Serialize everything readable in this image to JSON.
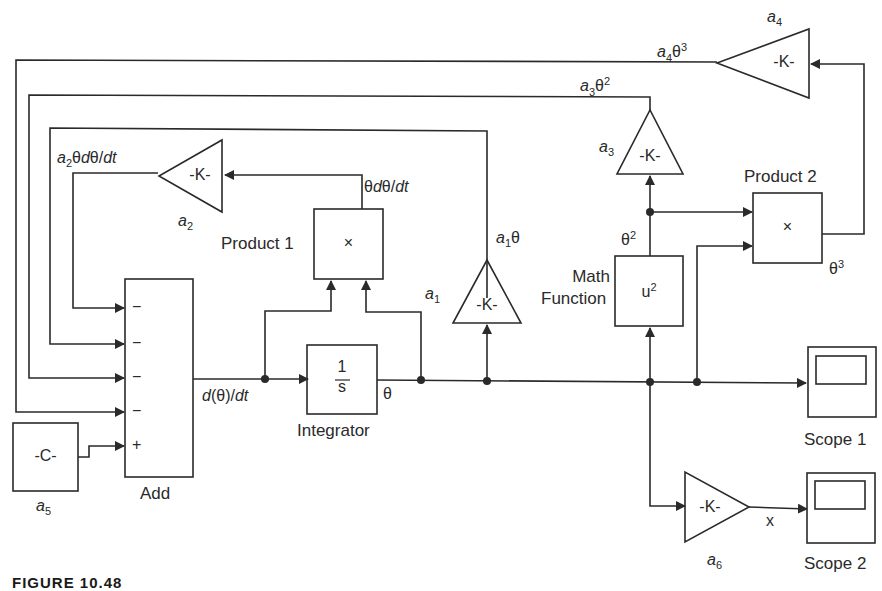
{
  "diagram": {
    "type": "simulink_block_diagram",
    "caption": "FIGURE 10.48",
    "blocks": {
      "add": {
        "name": "Add",
        "ports": [
          "−",
          "−",
          "−",
          "−",
          "+"
        ]
      },
      "constant": {
        "symbol": "-C-",
        "param": "a",
        "param_sub": "5"
      },
      "integrator": {
        "name": "Integrator",
        "num": "1",
        "den": "s"
      },
      "product1": {
        "name": "Product 1",
        "symbol": "×"
      },
      "product2": {
        "name": "Product 2",
        "symbol": "×"
      },
      "math_function": {
        "name_line1": "Math",
        "name_line2": "Function",
        "symbol": "u",
        "symbol_sup": "2"
      },
      "gain_a1": {
        "symbol": "-K-",
        "param": "a",
        "param_sub": "1"
      },
      "gain_a2": {
        "symbol": "-K-",
        "param": "a",
        "param_sub": "2"
      },
      "gain_a3": {
        "symbol": "-K-",
        "param": "a",
        "param_sub": "3"
      },
      "gain_a4": {
        "symbol": "-K-",
        "param": "a",
        "param_sub": "4"
      },
      "gain_a6": {
        "symbol": "-K-",
        "param": "a",
        "param_sub": "6"
      },
      "scope1": {
        "name": "Scope 1"
      },
      "scope2": {
        "name": "Scope 2"
      }
    },
    "signals": {
      "dtheta_dt": {
        "d": "d",
        "mid": "(θ)/",
        "dt": "dt"
      },
      "theta": "θ",
      "theta_sq": {
        "base": "θ",
        "sup": "2"
      },
      "theta_cu": {
        "base": "θ",
        "sup": "3"
      },
      "theta_dtheta": {
        "a": "θ",
        "d": "d",
        "b": "θ/",
        "dt": "dt"
      },
      "a1theta": {
        "a": "a",
        "sub": "1",
        "rest": "θ"
      },
      "a2term": {
        "a": "a",
        "sub": "2",
        "t": "θ",
        "d": "d",
        "b": "θ/",
        "dt": "dt"
      },
      "a3term": {
        "a": "a",
        "sub": "3",
        "base": "θ",
        "sup": "2"
      },
      "a4term": {
        "a": "a",
        "sub": "4",
        "base": "θ",
        "sup": "3"
      },
      "x": "x"
    },
    "colors": {
      "line": "#2a2a2a",
      "background": "#ffffff"
    }
  }
}
